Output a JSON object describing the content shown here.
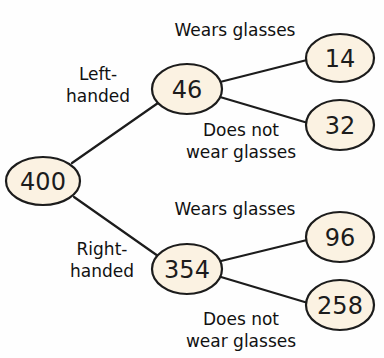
{
  "diagram": {
    "type": "tree-diagram",
    "colors": {
      "node_fill": "#fbf2e2",
      "stroke": "#1c1c1c",
      "text": "#111111"
    },
    "nodes": {
      "root": {
        "value": "400"
      },
      "left": {
        "value": "46"
      },
      "right": {
        "value": "354"
      },
      "left_glasses": {
        "value": "14"
      },
      "left_no_glasses": {
        "value": "32"
      },
      "right_glasses": {
        "value": "96"
      },
      "right_no_glasses": {
        "value": "258"
      }
    },
    "branch_labels": {
      "left_handed": [
        "Left-",
        "handed"
      ],
      "right_handed": [
        "Right-",
        "handed"
      ],
      "left_wears": "Wears glasses",
      "left_not": [
        "Does not",
        "wear glasses"
      ],
      "right_wears": "Wears glasses",
      "right_not": [
        "Does not",
        "wear glasses"
      ]
    }
  }
}
